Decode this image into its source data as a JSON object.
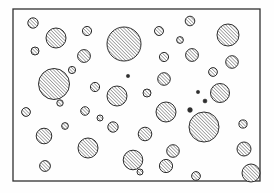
{
  "figure": {
    "title": "Hatched circle particle distribution",
    "canvas": {
      "width": 274,
      "height": 193
    },
    "background_color": "#fefefe",
    "frame": {
      "name": "figure-border",
      "x": 13,
      "y": 9,
      "width": 247,
      "height": 172,
      "stroke_color": "#303030",
      "stroke_width": 1.3,
      "fill_color": "#fefefe"
    },
    "hatch": {
      "angle_degrees": 45,
      "direction": "lower-left to upper-right",
      "line_color": "#3a3a3a",
      "line_width": 0.85,
      "spacing": 2.4
    },
    "circle_style": {
      "stroke_color": "#2e2e2e",
      "stroke_width": 1.0,
      "fill": "diagonal-hatch"
    },
    "counts": {
      "total_circles": 45,
      "tiny_dots": 3
    }
  },
  "chart_data": {
    "type": "scatter",
    "title": "Hatched circle particle distribution",
    "xlabel": "",
    "ylabel": "",
    "xlim": [
      13,
      260
    ],
    "ylim": [
      9,
      181
    ],
    "grid": false,
    "legend": null,
    "marker": "hatched-circle",
    "series": [
      {
        "name": "particles",
        "points": [
          {
            "cx": 33,
            "cy": 23,
            "r": 5.2
          },
          {
            "cx": 56,
            "cy": 38,
            "r": 10.0
          },
          {
            "cx": 35,
            "cy": 51,
            "r": 4.0
          },
          {
            "cx": 87,
            "cy": 31,
            "r": 4.6
          },
          {
            "cx": 124,
            "cy": 44,
            "r": 17.0
          },
          {
            "cx": 159,
            "cy": 31,
            "r": 4.5
          },
          {
            "cx": 190,
            "cy": 21,
            "r": 4.8
          },
          {
            "cx": 228,
            "cy": 35,
            "r": 11.0
          },
          {
            "cx": 84,
            "cy": 56,
            "r": 6.4
          },
          {
            "cx": 164,
            "cy": 57,
            "r": 4.6
          },
          {
            "cx": 192,
            "cy": 55,
            "r": 6.4
          },
          {
            "cx": 232,
            "cy": 62,
            "r": 6.3
          },
          {
            "cx": 54,
            "cy": 84,
            "r": 15.5
          },
          {
            "cx": 95,
            "cy": 87,
            "r": 4.6
          },
          {
            "cx": 164,
            "cy": 79,
            "r": 6.3
          },
          {
            "cx": 220,
            "cy": 93,
            "r": 9.5
          },
          {
            "cx": 128,
            "cy": 76,
            "r": 1.7
          },
          {
            "cx": 198,
            "cy": 92,
            "r": 1.7
          },
          {
            "cx": 190,
            "cy": 110,
            "r": 2.4
          },
          {
            "cx": 117,
            "cy": 96,
            "r": 10.0
          },
          {
            "cx": 26,
            "cy": 112,
            "r": 4.4
          },
          {
            "cx": 85,
            "cy": 111,
            "r": 4.3
          },
          {
            "cx": 166,
            "cy": 112,
            "r": 10.0
          },
          {
            "cx": 65,
            "cy": 126,
            "r": 3.4
          },
          {
            "cx": 113,
            "cy": 127,
            "r": 5.2
          },
          {
            "cx": 44,
            "cy": 136,
            "r": 7.8
          },
          {
            "cx": 145,
            "cy": 134,
            "r": 6.8
          },
          {
            "cx": 204,
            "cy": 127,
            "r": 15.0
          },
          {
            "cx": 243,
            "cy": 124,
            "r": 4.1
          },
          {
            "cx": 88,
            "cy": 148,
            "r": 10.0
          },
          {
            "cx": 173,
            "cy": 151,
            "r": 6.3
          },
          {
            "cx": 166,
            "cy": 166,
            "r": 6.6
          },
          {
            "cx": 244,
            "cy": 149,
            "r": 7.0
          },
          {
            "cx": 45,
            "cy": 166,
            "r": 5.4
          },
          {
            "cx": 133,
            "cy": 160,
            "r": 9.8
          },
          {
            "cx": 196,
            "cy": 176,
            "r": 4.4
          },
          {
            "cx": 251,
            "cy": 173,
            "r": 9.0
          },
          {
            "cx": 205,
            "cy": 101,
            "r": 2.0
          },
          {
            "cx": 72,
            "cy": 70,
            "r": 3.6
          },
          {
            "cx": 147,
            "cy": 93,
            "r": 4.0
          },
          {
            "cx": 213,
            "cy": 72,
            "r": 4.4
          },
          {
            "cx": 100,
            "cy": 118,
            "r": 3.0
          },
          {
            "cx": 60,
            "cy": 103,
            "r": 3.2
          },
          {
            "cx": 180,
            "cy": 40,
            "r": 3.4
          },
          {
            "cx": 140,
            "cy": 172,
            "r": 3.0
          }
        ]
      }
    ]
  }
}
